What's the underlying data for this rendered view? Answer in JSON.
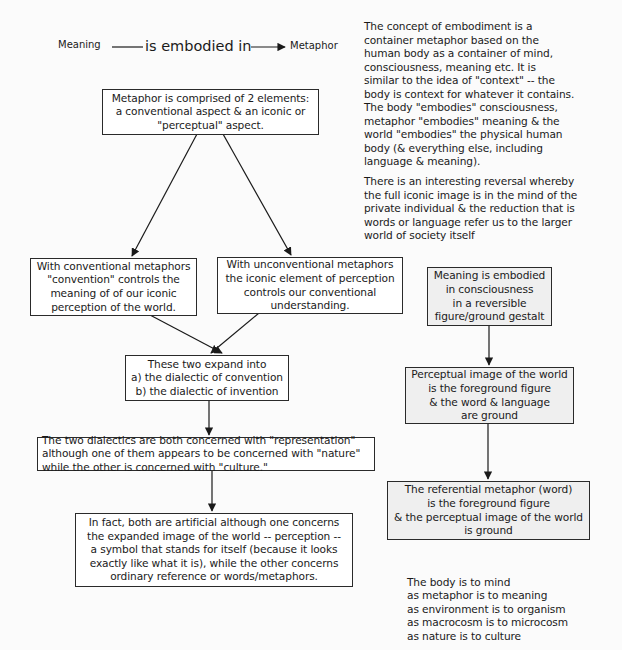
{
  "header": {
    "subject": "Meaning",
    "relation": "is embodied in",
    "object": "Metaphor"
  },
  "intro_text": {
    "paragraph1": [
      "The concept of embodiment is a",
      "container metaphor based on the",
      "human body as a container of mind,",
      "consciousness, meaning etc. It is",
      "similar to the idea of \"context\" -- the",
      "body is context for whatever it contains.",
      "The body \"embodies\" consciousness,",
      "metaphor \"embodies\" meaning & the",
      "world \"embodies\" the physical human",
      "body (& everything else, including",
      "language & meaning)."
    ],
    "paragraph2": [
      "There is an interesting reversal whereby",
      "the full iconic image is in the mind of the",
      "private individual & the reduction that is",
      "words or language refer us to the larger",
      "world of society itself"
    ]
  },
  "left_flow": {
    "root": [
      "Metaphor is comprised of 2 elements:",
      "a conventional aspect & an iconic or",
      "\"perceptual\" aspect."
    ],
    "conventional": [
      "With conventional metaphors",
      "\"convention\" controls the",
      "meaning of of our iconic",
      "perception of the world."
    ],
    "unconventional": [
      "With unconventional metaphors",
      "the iconic element of perception",
      "controls our conventional",
      "understanding."
    ],
    "expand": [
      "These two expand into",
      "a) the dialectic of convention",
      "b) the dialectic of invention"
    ],
    "dialectics": [
      "The two dialectics are both concerned with \"representation\"",
      "although one of them appears to be concerned with \"nature\"",
      "while the other is concerned with \"culture.\""
    ],
    "in_fact": [
      "In fact, both are artificial although one concerns",
      "the expanded image of the world -- perception --",
      "a symbol that stands for itself (because it looks",
      "exactly like what it is), while the other concerns",
      "ordinary reference or words/metaphors."
    ]
  },
  "right_flow": {
    "gestalt": [
      "Meaning is embodied",
      "in consciousness",
      "in a reversible",
      "figure/ground gestalt"
    ],
    "perceptual_figure": [
      "Perceptual image of the world",
      "is the foreground figure",
      "& the word & language",
      "are ground"
    ],
    "referential_figure": [
      "The referential metaphor (word)",
      "is the foreground figure",
      "& the perceptual image of the world",
      "is ground"
    ]
  },
  "analogy": [
    "The body is to mind",
    "as metaphor is to meaning",
    "as environment is to organism",
    "as macrocosm is to microcosm",
    "as nature is to culture"
  ],
  "colors": {
    "background": "#fbfbfb",
    "box_border": "#2a2a2a",
    "box_fill": "#ffffff",
    "gray_box_fill": "#efefef",
    "text": "#1a1a1a"
  }
}
